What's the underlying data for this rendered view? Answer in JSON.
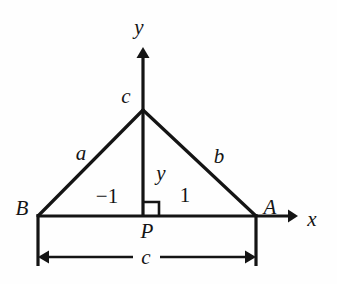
{
  "figure": {
    "type": "geometry-diagram",
    "background_color": "#fefefe",
    "stroke_color": "#141414"
  },
  "axes": {
    "x_label": "x",
    "y_label": "y",
    "origin_label": "P"
  },
  "vertices": {
    "left_label": "B",
    "right_label": "A",
    "foot_label": "P"
  },
  "sides": {
    "left_side_label": "a",
    "right_side_label": "b",
    "apex_label": "c",
    "base_label": "c",
    "altitude_label": "y"
  },
  "coordinates": {
    "left_x_label": "−1",
    "right_x_label": "1"
  },
  "geometry": {
    "apex": {
      "x": 143,
      "y": 110
    },
    "left_vertex": {
      "x": 38,
      "y": 216
    },
    "right_vertex": {
      "x": 256,
      "y": 216
    },
    "foot": {
      "x": 143,
      "y": 216
    },
    "x_axis_y": 216,
    "x_axis_end": 296,
    "y_axis_x": 143,
    "y_axis_top": 48,
    "dimension_line_y": 257,
    "tick_bottom_y": 266,
    "right_angle_size": 15
  },
  "label_positions": {
    "y_axis": {
      "x": 139,
      "y": 27
    },
    "x_axis": {
      "x": 312,
      "y": 219
    },
    "apex_c": {
      "x": 126,
      "y": 96
    },
    "side_a": {
      "x": 81,
      "y": 153
    },
    "side_b": {
      "x": 219,
      "y": 156
    },
    "altitude_y": {
      "x": 161,
      "y": 173
    },
    "neg_one": {
      "x": 107,
      "y": 196
    },
    "one": {
      "x": 185,
      "y": 195
    },
    "vertex_B": {
      "x": 22,
      "y": 208
    },
    "vertex_A": {
      "x": 270,
      "y": 207
    },
    "foot_P": {
      "x": 147,
      "y": 231
    },
    "base_c": {
      "x": 146,
      "y": 257
    }
  }
}
